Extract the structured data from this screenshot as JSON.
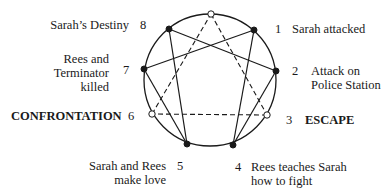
{
  "diagram": {
    "type": "enneagram",
    "circle": {
      "cx": 210,
      "cy": 80,
      "r": 66,
      "stroke": "#1a1a1a"
    },
    "nodes": [
      {
        "id": "9",
        "x": 211,
        "y": 14,
        "style": "open"
      },
      {
        "id": "1",
        "x": 254,
        "y": 30,
        "style": "filled"
      },
      {
        "id": "2",
        "x": 276,
        "y": 71,
        "style": "filled"
      },
      {
        "id": "3",
        "x": 267,
        "y": 115,
        "style": "open"
      },
      {
        "id": "4",
        "x": 233,
        "y": 145,
        "style": "filled"
      },
      {
        "id": "5",
        "x": 187,
        "y": 144,
        "style": "filled"
      },
      {
        "id": "6",
        "x": 152,
        "y": 114,
        "style": "open"
      },
      {
        "id": "7",
        "x": 144,
        "y": 69,
        "style": "filled"
      },
      {
        "id": "8",
        "x": 169,
        "y": 29,
        "style": "filled"
      }
    ],
    "solid_edges": [
      [
        "1",
        "4"
      ],
      [
        "4",
        "2"
      ],
      [
        "2",
        "8"
      ],
      [
        "8",
        "5"
      ],
      [
        "5",
        "7"
      ],
      [
        "7",
        "1"
      ]
    ],
    "dashed_edges": [
      [
        "9",
        "3"
      ],
      [
        "3",
        "6"
      ],
      [
        "6",
        "9"
      ]
    ]
  },
  "labels": {
    "p1": {
      "number": "1",
      "lines": [
        "Sarah attacked"
      ]
    },
    "p2": {
      "number": "2",
      "lines": [
        "Attack on",
        "Police Station"
      ]
    },
    "p3": {
      "number": "3",
      "lines": [
        "ESCAPE"
      ]
    },
    "p4": {
      "number": "4",
      "lines": [
        "Rees teaches Sarah",
        "how to fight"
      ]
    },
    "p5": {
      "number": "5",
      "lines": [
        "Sarah and Rees",
        "make love"
      ]
    },
    "p6": {
      "number": "6",
      "lines": [
        "CONFRONTATION"
      ]
    },
    "p7": {
      "number": "7",
      "lines": [
        "Rees and",
        "Terminator",
        "killed"
      ]
    },
    "p8": {
      "number": "8",
      "lines": [
        "Sarah’s Destiny"
      ]
    }
  }
}
